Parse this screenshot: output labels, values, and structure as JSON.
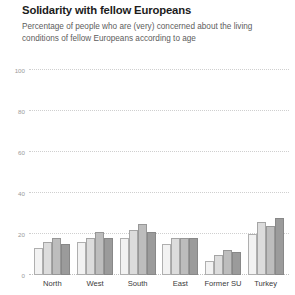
{
  "header": {
    "title": "Solidarity with fellow Europeans",
    "subtitle": "Percentage of people who are (very) concerned about the living conditions of fellow Europeans according to age"
  },
  "chart_data": {
    "type": "bar",
    "title": "Solidarity with fellow Europeans",
    "subtitle": "Percentage of people who are (very) concerned about the living conditions of fellow Europeans according to age",
    "xlabel": "",
    "ylabel": "",
    "ylim": [
      0,
      100
    ],
    "yticks": [
      0,
      20,
      40,
      60,
      80,
      100
    ],
    "ytick_labels": [
      "0",
      "20",
      "40",
      "60",
      "80",
      "100"
    ],
    "grid": true,
    "grid_style": "dotted",
    "legend": false,
    "legend_position": "none",
    "categories": [
      "North",
      "West",
      "South",
      "East",
      "Former SU",
      "Turkey"
    ],
    "series": [
      {
        "name": "age group 1",
        "color": "#f2f2f2",
        "values": [
          13,
          16,
          18,
          15,
          7,
          20
        ]
      },
      {
        "name": "age group 2",
        "color": "#dcdcdc",
        "values": [
          16,
          18,
          22,
          18,
          10,
          26
        ]
      },
      {
        "name": "age group 3",
        "color": "#bdbdbd",
        "values": [
          18,
          21,
          25,
          18,
          12,
          24
        ]
      },
      {
        "name": "age group 4",
        "color": "#9b9b9b",
        "values": [
          15,
          18,
          21,
          18,
          11,
          28
        ]
      }
    ]
  },
  "colors": {
    "title": "#1c1c1c",
    "subtitle": "#5d5d5d",
    "grid": "#cfcfcf",
    "tick": "#9a9a9a",
    "axis_label": "#3a3a3a",
    "background": "#ffffff"
  }
}
